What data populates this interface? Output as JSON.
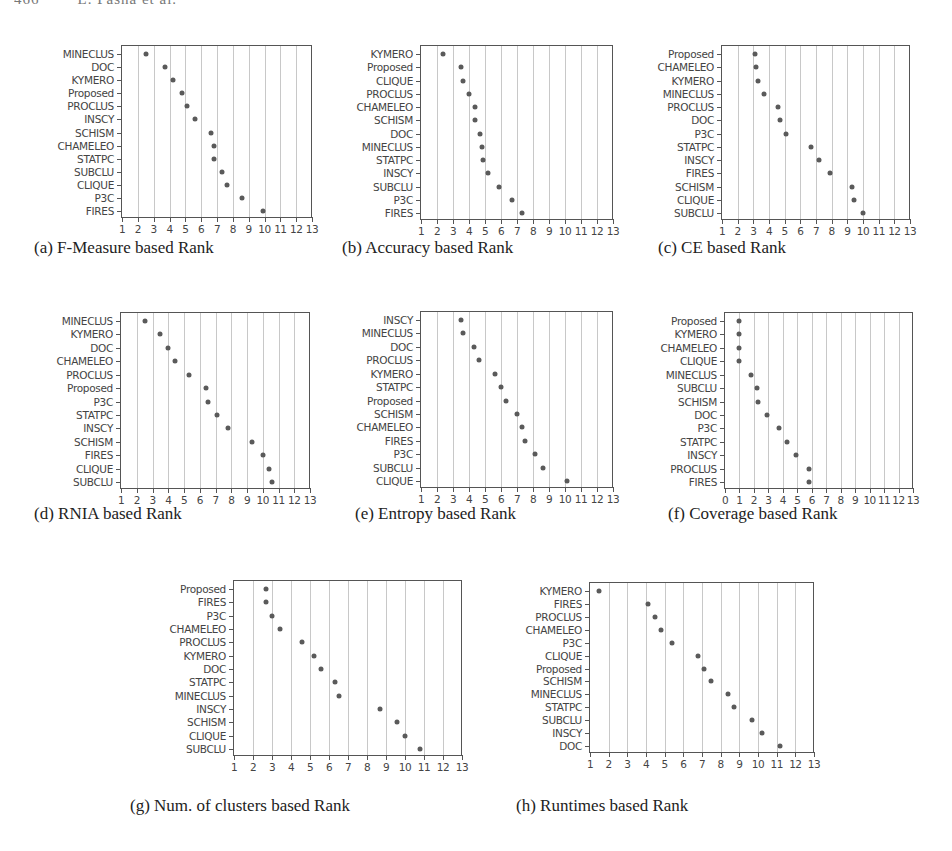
{
  "page": {
    "running_header": "466        L. Pasha et al."
  },
  "chart_data": [
    {
      "id": "a",
      "type": "scatter",
      "title": "(a) F-Measure based Rank",
      "xlabel": "",
      "ylabel": "",
      "xlim": [
        1,
        13
      ],
      "xticks": [
        "1",
        "2",
        "3",
        "4",
        "5",
        "6",
        "7",
        "8",
        "9",
        "10",
        "11",
        "12",
        "13"
      ],
      "grid": "vertical",
      "categories": [
        "MINECLUS",
        "DOC",
        "KYMERO",
        "Proposed",
        "PROCLUS",
        "INSCY",
        "SCHISM",
        "CHAMELEO",
        "STATPC",
        "SUBCLU",
        "CLIQUE",
        "P3C",
        "FIRES"
      ],
      "values": [
        2.5,
        3.7,
        4.2,
        4.8,
        5.1,
        5.6,
        6.6,
        6.8,
        6.8,
        7.3,
        7.6,
        8.6,
        9.9
      ],
      "box": {
        "left": 121,
        "top": 45,
        "width": 191,
        "height": 173
      }
    },
    {
      "id": "b",
      "type": "scatter",
      "title": "(b) Accuracy based Rank",
      "xlabel": "",
      "ylabel": "",
      "xlim": [
        1,
        13
      ],
      "xticks": [
        "1",
        "2",
        "3",
        "4",
        "5",
        "6",
        "7",
        "8",
        "9",
        "10",
        "11",
        "12",
        "13"
      ],
      "grid": "vertical",
      "categories": [
        "KYMERO",
        "Proposed",
        "CLIQUE",
        "PROCLUS",
        "CHAMELEO",
        "SCHISM",
        "DOC",
        "MINECLUS",
        "STATPC",
        "INSCY",
        "SUBCLU",
        "P3C",
        "FIRES"
      ],
      "values": [
        2.4,
        3.5,
        3.6,
        4.0,
        4.4,
        4.4,
        4.7,
        4.8,
        4.9,
        5.2,
        5.9,
        6.7,
        7.3
      ],
      "box": {
        "left": 420,
        "top": 45,
        "width": 193,
        "height": 175
      }
    },
    {
      "id": "c",
      "type": "scatter",
      "title": "(c) CE based Rank",
      "xlabel": "",
      "ylabel": "",
      "xlim": [
        1,
        13
      ],
      "xticks": [
        "1",
        "2",
        "3",
        "4",
        "5",
        "6",
        "7",
        "8",
        "9",
        "10",
        "11",
        "12",
        "13"
      ],
      "grid": "vertical",
      "categories": [
        "Proposed",
        "CHAMELEO",
        "KYMERO",
        "MINECLUS",
        "PROCLUS",
        "DOC",
        "P3C",
        "STATPC",
        "INSCY",
        "FIRES",
        "SCHISM",
        "CLIQUE",
        "SUBCLU"
      ],
      "values": [
        3.1,
        3.15,
        3.3,
        3.7,
        4.6,
        4.7,
        5.1,
        6.7,
        7.2,
        7.9,
        9.3,
        9.4,
        10.0
      ],
      "box": {
        "left": 721,
        "top": 45,
        "width": 189,
        "height": 175
      }
    },
    {
      "id": "d",
      "type": "scatter",
      "title": "(d) RNIA based Rank",
      "xlabel": "",
      "ylabel": "",
      "xlim": [
        1,
        13
      ],
      "xticks": [
        "1",
        "2",
        "3",
        "4",
        "5",
        "6",
        "7",
        "8",
        "9",
        "10",
        "11",
        "12",
        "13"
      ],
      "grid": "vertical",
      "categories": [
        "MINECLUS",
        "KYMERO",
        "DOC",
        "CHAMELEO",
        "PROCLUS",
        "Proposed",
        "P3C",
        "STATPC",
        "INSCY",
        "SCHISM",
        "FIRES",
        "CLIQUE",
        "SUBCLU"
      ],
      "values": [
        2.5,
        3.5,
        4.0,
        4.4,
        5.3,
        6.4,
        6.5,
        7.1,
        7.8,
        9.3,
        10.0,
        10.4,
        10.6
      ],
      "box": {
        "left": 120,
        "top": 312,
        "width": 190,
        "height": 177
      }
    },
    {
      "id": "e",
      "type": "scatter",
      "title": "(e) Entropy based Rank",
      "xlabel": "",
      "ylabel": "",
      "xlim": [
        1,
        13
      ],
      "xticks": [
        "1",
        "2",
        "3",
        "4",
        "5",
        "6",
        "7",
        "8",
        "9",
        "10",
        "11",
        "12",
        "13"
      ],
      "grid": "vertical",
      "categories": [
        "INSCY",
        "MINECLUS",
        "DOC",
        "PROCLUS",
        "KYMERO",
        "STATPC",
        "Proposed",
        "SCHISM",
        "CHAMELEO",
        "FIRES",
        "P3C",
        "SUBCLU",
        "CLIQUE"
      ],
      "values": [
        3.5,
        3.6,
        4.3,
        4.6,
        5.6,
        6.0,
        6.3,
        7.0,
        7.3,
        7.5,
        8.1,
        8.6,
        10.1
      ],
      "box": {
        "left": 420,
        "top": 311,
        "width": 193,
        "height": 177
      }
    },
    {
      "id": "f",
      "type": "scatter",
      "title": "(f) Coverage based Rank",
      "xlabel": "",
      "ylabel": "",
      "xlim": [
        0,
        13
      ],
      "xticks": [
        "0",
        "1",
        "2",
        "3",
        "4",
        "5",
        "6",
        "7",
        "8",
        "9",
        "10",
        "11",
        "12",
        "13"
      ],
      "grid": "vertical",
      "categories": [
        "Proposed",
        "KYMERO",
        "CHAMELEO",
        "CLIQUE",
        "MINECLUS",
        "SUBCLU",
        "SCHISM",
        "DOC",
        "P3C",
        "STATPC",
        "INSCY",
        "PROCLUS",
        "FIRES"
      ],
      "values": [
        1.0,
        1.0,
        1.0,
        1.0,
        1.8,
        2.2,
        2.3,
        2.9,
        3.7,
        4.3,
        4.9,
        5.8,
        5.8
      ],
      "box": {
        "left": 724,
        "top": 312,
        "width": 189,
        "height": 177
      }
    },
    {
      "id": "g",
      "type": "scatter",
      "title": "(g) Num. of clusters based Rank",
      "xlabel": "",
      "ylabel": "",
      "xlim": [
        1,
        13
      ],
      "xticks": [
        "1",
        "2",
        "3",
        "4",
        "5",
        "6",
        "7",
        "8",
        "9",
        "10",
        "11",
        "12",
        "13"
      ],
      "grid": "vertical",
      "categories": [
        "Proposed",
        "FIRES",
        "P3C",
        "CHAMELEO",
        "PROCLUS",
        "KYMERO",
        "DOC",
        "STATPC",
        "MINECLUS",
        "INSCY",
        "SCHISM",
        "CLIQUE",
        "SUBCLU"
      ],
      "values": [
        2.7,
        2.7,
        3.0,
        3.4,
        4.6,
        5.2,
        5.6,
        6.3,
        6.5,
        8.7,
        9.6,
        10.0,
        10.8
      ],
      "box": {
        "left": 233,
        "top": 580,
        "width": 229,
        "height": 176
      }
    },
    {
      "id": "h",
      "type": "scatter",
      "title": "(h) Runtimes based Rank",
      "xlabel": "",
      "ylabel": "",
      "xlim": [
        1,
        13
      ],
      "xticks": [
        "1",
        "2",
        "3",
        "4",
        "5",
        "6",
        "7",
        "8",
        "9",
        "10",
        "11",
        "12",
        "13"
      ],
      "grid": "vertical",
      "categories": [
        "KYMERO",
        "FIRES",
        "PROCLUS",
        "CHAMELEO",
        "P3C",
        "CLIQUE",
        "Proposed",
        "SCHISM",
        "MINECLUS",
        "STATPC",
        "SUBCLU",
        "INSCY",
        "DOC"
      ],
      "values": [
        1.5,
        4.1,
        4.5,
        4.8,
        5.4,
        6.8,
        7.1,
        7.5,
        8.4,
        8.7,
        9.7,
        10.2,
        11.2
      ],
      "box": {
        "left": 589,
        "top": 582,
        "width": 225,
        "height": 171
      }
    }
  ],
  "captions": [
    {
      "id": "a",
      "text": "(a) F-Measure based Rank",
      "left": 34,
      "top": 238
    },
    {
      "id": "b",
      "text": "(b) Accuracy based Rank",
      "left": 342,
      "top": 238
    },
    {
      "id": "c",
      "text": "(c) CE based Rank",
      "left": 658,
      "top": 238
    },
    {
      "id": "d",
      "text": "(d) RNIA based Rank",
      "left": 34,
      "top": 504
    },
    {
      "id": "e",
      "text": "(e) Entropy based Rank",
      "left": 355,
      "top": 504
    },
    {
      "id": "f",
      "text": "(f) Coverage based Rank",
      "left": 668,
      "top": 504
    },
    {
      "id": "g",
      "text": "(g) Num. of clusters based Rank",
      "left": 130,
      "top": 796
    },
    {
      "id": "h",
      "text": "(h) Runtimes based Rank",
      "left": 516,
      "top": 796
    }
  ],
  "style": {
    "dot_color": "#5a5a5a",
    "grid_color": "#c8c8c8",
    "axis_color": "#555555"
  }
}
